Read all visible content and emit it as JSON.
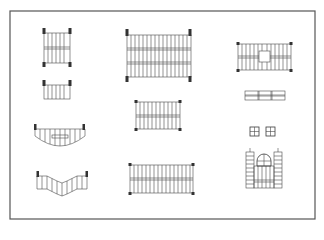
{
  "diagram": {
    "title": "Fence and railing panel layouts",
    "line_color": "#4a4a4a",
    "post_color": "#333333",
    "background": "#ffffff",
    "frame": {
      "x": 10,
      "y": 11,
      "w": 305,
      "h": 208
    },
    "figures": [
      {
        "id": "a",
        "label": "double-rail panel with corner posts"
      },
      {
        "id": "b",
        "label": "single low panel with posts"
      },
      {
        "id": "c",
        "label": "concave curved panel"
      },
      {
        "id": "d",
        "label": "zigzag stepped panel"
      },
      {
        "id": "e",
        "label": "large triple-rail panel"
      },
      {
        "id": "f",
        "label": "medium double-rail panel"
      },
      {
        "id": "g",
        "label": "wide double-rail panel"
      },
      {
        "id": "h",
        "label": "panel with central window"
      },
      {
        "id": "i",
        "label": "horizontal three-section strip"
      },
      {
        "id": "j",
        "label": "pair of window squares"
      },
      {
        "id": "k",
        "label": "gate with side towers and arched window"
      }
    ]
  }
}
